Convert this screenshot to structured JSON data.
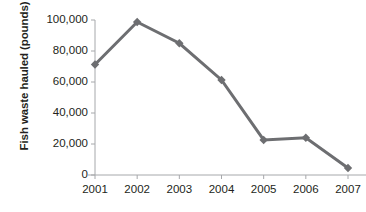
{
  "chart_data": {
    "type": "line",
    "title": "",
    "xlabel": "",
    "ylabel": "Fish waste hauled (pounds)",
    "categories": [
      "2001",
      "2002",
      "2003",
      "2004",
      "2005",
      "2006",
      "2007"
    ],
    "values": [
      71300,
      98700,
      85000,
      61300,
      22600,
      24000,
      4500
    ],
    "series": [
      {
        "name": "Fish waste hauled",
        "values": [
          71300,
          98700,
          85000,
          61300,
          22600,
          24000,
          4500
        ],
        "color": "#6d6e71",
        "marker": "diamond"
      }
    ],
    "ylim": [
      0,
      100000
    ],
    "ytick_values": [
      0,
      20000,
      40000,
      60000,
      80000,
      100000
    ],
    "ytick_labels": [
      "0",
      "20,000",
      "40,000",
      "60,000",
      "80,000",
      "100,000"
    ],
    "xtick_labels": [
      "2001",
      "2002",
      "2003",
      "2004",
      "2005",
      "2006",
      "2007"
    ],
    "grid": false,
    "legend": "none",
    "axis_color": "#a6a8ab",
    "text_color": "#231f20"
  },
  "axis": {
    "y_title": "Fish waste hauled (pounds)",
    "y_ticks": [
      {
        "label": "100,000",
        "value": 100000
      },
      {
        "label": "80,000",
        "value": 80000
      },
      {
        "label": "60,000",
        "value": 60000
      },
      {
        "label": "40,000",
        "value": 40000
      },
      {
        "label": "20,000",
        "value": 20000
      },
      {
        "label": "0",
        "value": 0
      }
    ],
    "x_ticks": [
      {
        "label": "2001"
      },
      {
        "label": "2002"
      },
      {
        "label": "2003"
      },
      {
        "label": "2004"
      },
      {
        "label": "2005"
      },
      {
        "label": "2006"
      },
      {
        "label": "2007"
      }
    ]
  }
}
